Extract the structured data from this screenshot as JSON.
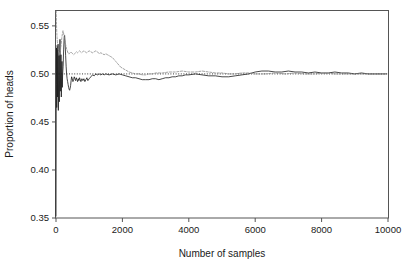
{
  "chart_data": {
    "type": "line",
    "title": "",
    "subtitle": "",
    "xlabel": "Number of samples",
    "ylabel": "Proportion of heads",
    "xlim": [
      0,
      10000
    ],
    "ylim": [
      0.35,
      0.5655
    ],
    "xticks": [
      0,
      2000,
      4000,
      6000,
      8000,
      10000
    ],
    "xticklabels": [
      "0",
      "2000",
      "4000",
      "6000",
      "8000",
      "10000"
    ],
    "yticks": [
      0.35,
      0.4,
      0.45,
      0.5,
      0.55
    ],
    "yticklabels": [
      "0.35",
      "0.40",
      "0.45",
      "0.50",
      "0.55"
    ],
    "grid": false,
    "legend": "none",
    "annotations": [
      {
        "kind": "hline",
        "y": 0.5,
        "style": "dotted",
        "label": "0.50 reference"
      }
    ],
    "series": [
      {
        "name": "run-1",
        "style": "solid",
        "color": "#1b1b1b",
        "x": [
          1,
          8,
          15,
          22,
          30,
          38,
          46,
          54,
          62,
          70,
          80,
          90,
          100,
          110,
          120,
          130,
          140,
          150,
          160,
          170,
          180,
          190,
          200,
          215,
          230,
          245,
          260,
          275,
          290,
          305,
          320,
          335,
          350,
          365,
          380,
          395,
          410,
          425,
          440,
          455,
          470,
          490,
          510,
          530,
          550,
          570,
          590,
          610,
          630,
          650,
          670,
          690,
          710,
          730,
          750,
          780,
          810,
          840,
          870,
          900,
          930,
          960,
          1000,
          1050,
          1100,
          1150,
          1200,
          1250,
          1300,
          1350,
          1400,
          1450,
          1500,
          1600,
          1700,
          1800,
          1900,
          2000,
          2100,
          2200,
          2300,
          2400,
          2500,
          2600,
          2700,
          2800,
          2900,
          3000,
          3100,
          3200,
          3300,
          3400,
          3500,
          3600,
          3700,
          3800,
          3900,
          4000,
          4200,
          4400,
          4600,
          4800,
          5000,
          5200,
          5400,
          5600,
          5800,
          6000,
          6200,
          6400,
          6600,
          6800,
          7000,
          7200,
          7400,
          7600,
          7800,
          8000,
          8200,
          8400,
          8600,
          8800,
          9000,
          9200,
          9400,
          9600,
          9800,
          9950
        ],
        "y": [
          0.352,
          0.489,
          0.527,
          0.465,
          0.502,
          0.53,
          0.476,
          0.508,
          0.531,
          0.462,
          0.498,
          0.519,
          0.471,
          0.503,
          0.536,
          0.482,
          0.501,
          0.52,
          0.476,
          0.499,
          0.513,
          0.486,
          0.5,
          0.508,
          0.525,
          0.537,
          0.54,
          0.531,
          0.519,
          0.508,
          0.5,
          0.495,
          0.492,
          0.489,
          0.486,
          0.484,
          0.483,
          0.485,
          0.488,
          0.493,
          0.497,
          0.495,
          0.492,
          0.494,
          0.497,
          0.495,
          0.493,
          0.496,
          0.494,
          0.492,
          0.495,
          0.493,
          0.496,
          0.494,
          0.492,
          0.495,
          0.493,
          0.495,
          0.492,
          0.494,
          0.496,
          0.493,
          0.495,
          0.497,
          0.499,
          0.498,
          0.5,
          0.499,
          0.5,
          0.499,
          0.5,
          0.499,
          0.5,
          0.499,
          0.5,
          0.499,
          0.5,
          0.499,
          0.498,
          0.497,
          0.496,
          0.496,
          0.495,
          0.494,
          0.494,
          0.494,
          0.495,
          0.495,
          0.494,
          0.495,
          0.496,
          0.496,
          0.497,
          0.497,
          0.498,
          0.498,
          0.499,
          0.499,
          0.5,
          0.499,
          0.498,
          0.498,
          0.497,
          0.497,
          0.498,
          0.499,
          0.5,
          0.502,
          0.503,
          0.503,
          0.502,
          0.502,
          0.503,
          0.502,
          0.502,
          0.501,
          0.502,
          0.501,
          0.501,
          0.502,
          0.501,
          0.501,
          0.5,
          0.501,
          0.5,
          0.5,
          0.5,
          0.5
        ]
      },
      {
        "name": "run-2",
        "style": "dashed",
        "color": "#8c8c8c",
        "x": [
          1,
          6,
          12,
          18,
          25,
          32,
          40,
          48,
          56,
          64,
          72,
          80,
          90,
          100,
          112,
          124,
          136,
          150,
          165,
          180,
          195,
          210,
          225,
          240,
          260,
          280,
          300,
          320,
          340,
          360,
          380,
          400,
          425,
          450,
          475,
          500,
          530,
          560,
          590,
          620,
          650,
          680,
          710,
          740,
          770,
          800,
          840,
          880,
          920,
          960,
          1000,
          1050,
          1100,
          1150,
          1200,
          1250,
          1300,
          1350,
          1400,
          1450,
          1500,
          1550,
          1600,
          1650,
          1700,
          1750,
          1800,
          1850,
          1900,
          1950,
          2000,
          2100,
          2200,
          2300,
          2400,
          2500,
          2600,
          2700,
          2800,
          2900,
          3000,
          3200,
          3400,
          3600,
          3800,
          4000,
          4200,
          4400,
          4600,
          4800,
          5000,
          5200,
          5400,
          5600,
          5800,
          6000,
          6300,
          6600,
          6900,
          7200,
          7500,
          7800,
          8100,
          8400,
          8700,
          9000,
          9300,
          9600,
          9900
        ],
        "y": [
          0.58,
          0.566,
          0.556,
          0.548,
          0.542,
          0.538,
          0.534,
          0.531,
          0.528,
          0.526,
          0.524,
          0.523,
          0.522,
          0.521,
          0.52,
          0.522,
          0.525,
          0.529,
          0.534,
          0.539,
          0.542,
          0.545,
          0.543,
          0.54,
          0.536,
          0.532,
          0.529,
          0.526,
          0.524,
          0.522,
          0.521,
          0.521,
          0.522,
          0.523,
          0.522,
          0.521,
          0.52,
          0.521,
          0.522,
          0.523,
          0.522,
          0.523,
          0.524,
          0.523,
          0.522,
          0.523,
          0.524,
          0.523,
          0.522,
          0.523,
          0.524,
          0.523,
          0.522,
          0.523,
          0.524,
          0.523,
          0.521,
          0.522,
          0.521,
          0.52,
          0.521,
          0.52,
          0.519,
          0.518,
          0.517,
          0.515,
          0.513,
          0.511,
          0.509,
          0.507,
          0.506,
          0.504,
          0.502,
          0.501,
          0.5,
          0.5,
          0.499,
          0.499,
          0.5,
          0.5,
          0.501,
          0.501,
          0.502,
          0.502,
          0.503,
          0.502,
          0.502,
          0.503,
          0.502,
          0.501,
          0.501,
          0.5,
          0.5,
          0.501,
          0.501,
          0.5,
          0.5,
          0.501,
          0.5,
          0.501,
          0.5,
          0.5,
          0.501,
          0.5,
          0.5,
          0.5,
          0.5,
          0.5,
          0.5
        ]
      }
    ]
  }
}
